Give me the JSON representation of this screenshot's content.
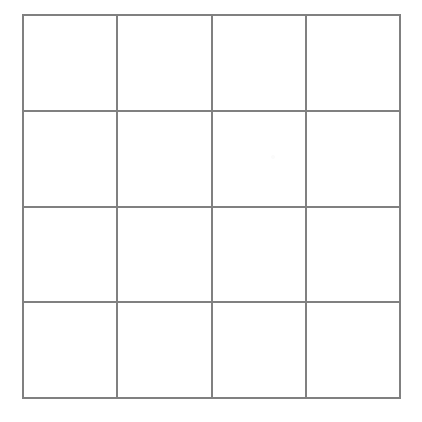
{
  "figure": {
    "name": "blank-4x4-grid",
    "title": "",
    "rows": 4,
    "columns": 4,
    "cell_count": 16,
    "line_color": "#808080",
    "line_width_px": 2,
    "background_color": "#ffffff",
    "bounds": {
      "left": 22,
      "top": 14,
      "right": 401,
      "bottom": 399,
      "width": 379,
      "height": 385
    },
    "vertical_line_x": [
      23,
      118,
      212,
      306,
      400
    ],
    "horizontal_line_y": [
      15,
      110,
      207,
      304,
      398
    ],
    "cells": [
      {
        "row": 1,
        "column": 1,
        "label": ""
      },
      {
        "row": 1,
        "column": 2,
        "label": ""
      },
      {
        "row": 1,
        "column": 3,
        "label": ""
      },
      {
        "row": 1,
        "column": 4,
        "label": ""
      },
      {
        "row": 2,
        "column": 1,
        "label": ""
      },
      {
        "row": 2,
        "column": 2,
        "label": ""
      },
      {
        "row": 2,
        "column": 3,
        "label": ""
      },
      {
        "row": 2,
        "column": 4,
        "label": ""
      },
      {
        "row": 3,
        "column": 1,
        "label": ""
      },
      {
        "row": 3,
        "column": 2,
        "label": ""
      },
      {
        "row": 3,
        "column": 3,
        "label": ""
      },
      {
        "row": 3,
        "column": 4,
        "label": ""
      },
      {
        "row": 4,
        "column": 1,
        "label": ""
      },
      {
        "row": 4,
        "column": 2,
        "label": ""
      },
      {
        "row": 4,
        "column": 3,
        "label": ""
      },
      {
        "row": 4,
        "column": 4,
        "label": ""
      }
    ]
  }
}
